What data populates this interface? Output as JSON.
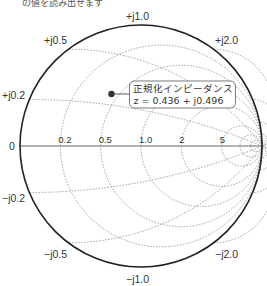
{
  "caption": "の値を読み出せます",
  "chart": {
    "type": "smith_chart",
    "center": [
      141,
      146
    ],
    "radius": 121,
    "outline_color": "#222222",
    "grid_color": "#888888",
    "axis_color": "#999999",
    "resistance_circles": [
      0.2,
      0.5,
      1.0,
      2,
      5
    ],
    "reactance_arcs": [
      0.2,
      0.5,
      1.0,
      2.0,
      5.0
    ],
    "labels": {
      "top": "+j1.0",
      "bottom": "−j1.0",
      "upper_left": "+j0.5",
      "upper_right": "+j2.0",
      "lower_left": "−j0.5",
      "lower_right": "−j2.0",
      "left_upper": "+j0.2",
      "left_lower": "−j0.2",
      "left_zero": "0",
      "axis_ticks": [
        "0.2",
        "0.5",
        "1.0",
        "2",
        "5"
      ]
    },
    "marker": {
      "z_real": 0.436,
      "z_imag": 0.496,
      "color": "#333333"
    },
    "callout": {
      "line1": "正規化インピーダンス",
      "line2": "z = 0.436 + j0.496"
    }
  }
}
